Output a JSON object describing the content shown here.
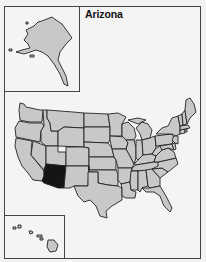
{
  "title": "Arizona",
  "colors": {
    "state_fill": "#c8c8c8",
    "highlight_fill": "#151515",
    "border": "#222222",
    "background": "#f4f4f4"
  },
  "highlighted_state": "Arizona",
  "insets": [
    {
      "name": "Alaska",
      "highlighted": false
    },
    {
      "name": "Hawaii",
      "highlighted": false
    }
  ],
  "states": [
    {
      "name": "Washington",
      "highlighted": false
    },
    {
      "name": "Oregon",
      "highlighted": false
    },
    {
      "name": "California",
      "highlighted": false
    },
    {
      "name": "Idaho",
      "highlighted": false
    },
    {
      "name": "Nevada",
      "highlighted": false
    },
    {
      "name": "Montana",
      "highlighted": false
    },
    {
      "name": "Wyoming",
      "highlighted": false
    },
    {
      "name": "Utah",
      "highlighted": false
    },
    {
      "name": "Arizona",
      "highlighted": true
    },
    {
      "name": "Colorado",
      "highlighted": false
    },
    {
      "name": "New Mexico",
      "highlighted": false
    },
    {
      "name": "North Dakota",
      "highlighted": false
    },
    {
      "name": "South Dakota",
      "highlighted": false
    },
    {
      "name": "Nebraska",
      "highlighted": false
    },
    {
      "name": "Kansas",
      "highlighted": false
    },
    {
      "name": "Oklahoma",
      "highlighted": false
    },
    {
      "name": "Texas",
      "highlighted": false
    },
    {
      "name": "Minnesota",
      "highlighted": false
    },
    {
      "name": "Iowa",
      "highlighted": false
    },
    {
      "name": "Missouri",
      "highlighted": false
    },
    {
      "name": "Arkansas",
      "highlighted": false
    },
    {
      "name": "Louisiana",
      "highlighted": false
    },
    {
      "name": "Wisconsin",
      "highlighted": false
    },
    {
      "name": "Illinois",
      "highlighted": false
    },
    {
      "name": "Michigan",
      "highlighted": false
    },
    {
      "name": "Indiana",
      "highlighted": false
    },
    {
      "name": "Ohio",
      "highlighted": false
    },
    {
      "name": "Kentucky",
      "highlighted": false
    },
    {
      "name": "Tennessee",
      "highlighted": false
    },
    {
      "name": "Mississippi",
      "highlighted": false
    },
    {
      "name": "Alabama",
      "highlighted": false
    },
    {
      "name": "Georgia",
      "highlighted": false
    },
    {
      "name": "Florida",
      "highlighted": false
    },
    {
      "name": "South Carolina",
      "highlighted": false
    },
    {
      "name": "North Carolina",
      "highlighted": false
    },
    {
      "name": "Virginia",
      "highlighted": false
    },
    {
      "name": "West Virginia",
      "highlighted": false
    },
    {
      "name": "Pennsylvania",
      "highlighted": false
    },
    {
      "name": "New York",
      "highlighted": false
    },
    {
      "name": "Maryland",
      "highlighted": false
    },
    {
      "name": "Delaware",
      "highlighted": false
    },
    {
      "name": "New Jersey",
      "highlighted": false
    },
    {
      "name": "Connecticut",
      "highlighted": false
    },
    {
      "name": "Rhode Island",
      "highlighted": false
    },
    {
      "name": "Massachusetts",
      "highlighted": false
    },
    {
      "name": "Vermont",
      "highlighted": false
    },
    {
      "name": "New Hampshire",
      "highlighted": false
    },
    {
      "name": "Maine",
      "highlighted": false
    }
  ]
}
